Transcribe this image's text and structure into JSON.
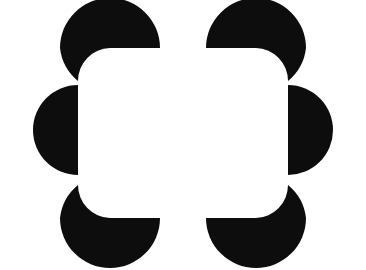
{
  "image": {
    "title": "Kanizsa illusory-contour figure",
    "width": 366,
    "height": 270,
    "background_color": "#ffffff",
    "foreground_color": "#0d0d0d",
    "shape_count": 6,
    "illusory_percept": "white rounded rectangle"
  },
  "figure": {
    "inducers": [
      {
        "id": "inducer-top-left",
        "name": "top-left-pacman",
        "position": "top-left",
        "type": "circle-with-concave-bite",
        "center_x": 110,
        "center_y": 48,
        "radius": 50,
        "bite_corner": "bottom-right",
        "flat_edge": "bottom-horizontal",
        "concave_edge": "right-vertical"
      },
      {
        "id": "inducer-top-right",
        "name": "top-right-pacman",
        "position": "top-right",
        "type": "circle-with-concave-bite",
        "center_x": 256,
        "center_y": 48,
        "radius": 50,
        "bite_corner": "bottom-left",
        "flat_edge": "bottom-horizontal",
        "concave_edge": "left-vertical"
      },
      {
        "id": "inducer-left-middle",
        "name": "left-semicircle",
        "position": "left-middle",
        "type": "semicircle",
        "center_x": 78,
        "center_y": 130,
        "radius": 45,
        "flat_edge": "right-vertical",
        "concave_edge": "none"
      },
      {
        "id": "inducer-right-middle",
        "name": "right-semicircle",
        "position": "right-middle",
        "type": "semicircle",
        "center_x": 303,
        "center_y": 130,
        "radius": 45,
        "flat_edge": "left-vertical",
        "concave_edge": "none"
      },
      {
        "id": "inducer-bottom-left",
        "name": "bottom-left-pacman",
        "position": "bottom-left",
        "type": "circle-with-concave-bite",
        "center_x": 110,
        "center_y": 218,
        "radius": 50,
        "bite_corner": "top-right",
        "flat_edge": "top-horizontal",
        "concave_edge": "right-vertical"
      },
      {
        "id": "inducer-bottom-right",
        "name": "bottom-right-pacman",
        "position": "bottom-right",
        "type": "circle-with-concave-bite",
        "center_x": 256,
        "center_y": 218,
        "radius": 50,
        "bite_corner": "top-left",
        "flat_edge": "top-horizontal",
        "concave_edge": "left-vertical"
      }
    ],
    "paths": {
      "top_left": "M 110 48 m -50 0 a 50 50 0 0 1 50 -50 a 50 50 0 0 1 50 50 L 110 48 A 33 33 0 0 0 78 81 A 50 50 0 0 1 60 48 Z",
      "top_right": "M 256 48 m 50 0 a 50 50 0 0 0 -50 -50 a 50 50 0 0 0 -50 50 L 256 48 A 33 33 0 0 1 288 81 A 50 50 0 0 0 306 48 Z",
      "left_middle": "M 78 85 A 45 45 0 0 0 78 175 Z",
      "right_middle": "M 288 85 A 45 45 0 0 1 288 175 Z",
      "bottom_left": "M 110 218 m -50 0 a 50 50 0 0 0 50 50 a 50 50 0 0 0 50 -50 L 110 218 A 33 33 0 0 1 78 185 A 50 50 0 0 0 60 218 Z",
      "bottom_right": "M 256 218 m 50 0 a 50 50 0 0 1 -50 50 a 50 50 0 0 1 -50 -50 L 256 218 A 33 33 0 0 0 288 185 A 50 50 0 0 1 306 218 Z"
    }
  }
}
